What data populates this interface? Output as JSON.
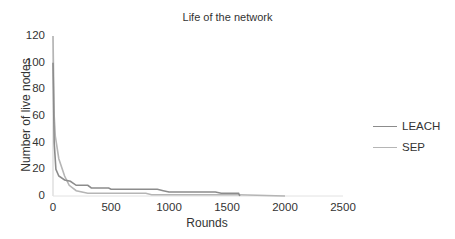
{
  "chart_data": {
    "type": "line",
    "title": "Life of the network",
    "xlabel": "Rounds",
    "ylabel": "Number of live nodes",
    "xlim": [
      0,
      2500
    ],
    "ylim": [
      0,
      120
    ],
    "x_ticks": [
      "0",
      "500",
      "1000",
      "1500",
      "2000",
      "2500"
    ],
    "y_ticks": [
      "0",
      "20",
      "40",
      "60",
      "80",
      "100",
      "120"
    ],
    "grid": false,
    "legend_position": "right",
    "series": [
      {
        "name": "LEACH",
        "color": "#8c8c8c",
        "x": [
          0,
          10,
          25,
          50,
          100,
          150,
          200,
          300,
          330,
          480,
          500,
          900,
          950,
          1000,
          1400,
          1450,
          1600,
          1610
        ],
        "y": [
          100,
          40,
          20,
          15,
          12,
          11,
          8,
          8,
          6,
          6,
          5,
          5,
          4,
          3,
          3,
          2,
          2,
          0
        ]
      },
      {
        "name": "SEP",
        "color": "#b5b5b5",
        "x": [
          0,
          10,
          20,
          50,
          100,
          140,
          200,
          250,
          300,
          800,
          850,
          1600,
          2000
        ],
        "y": [
          120,
          60,
          45,
          28,
          15,
          8,
          4,
          3,
          2,
          2,
          1,
          1,
          0
        ]
      }
    ]
  },
  "legend": {
    "items": [
      {
        "label": "LEACH",
        "color": "#8c8c8c"
      },
      {
        "label": "SEP",
        "color": "#b5b5b5"
      }
    ]
  }
}
